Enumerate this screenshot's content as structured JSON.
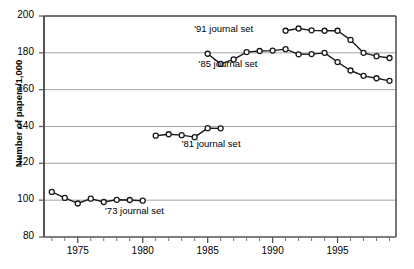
{
  "chart_data": {
    "type": "line",
    "title": "",
    "xlabel": "",
    "ylabel": "Number of papers/1,000",
    "xlim": [
      1972.4,
      1999.5
    ],
    "ylim": [
      80,
      200
    ],
    "ytick_values": [
      80,
      100,
      120,
      140,
      160,
      180,
      200
    ],
    "ytick_labels": [
      "80",
      "100",
      "120",
      "140",
      "160",
      "180",
      "200"
    ],
    "xtick_values": [
      1975,
      1980,
      1985,
      1990,
      1995
    ],
    "xtick_labels": [
      "1975",
      "1980",
      "1985",
      "1990",
      "1995"
    ],
    "xtick_minor_values": [
      1973,
      1974,
      1976,
      1977,
      1978,
      1979,
      1981,
      1982,
      1983,
      1984,
      1986,
      1987,
      1988,
      1989,
      1991,
      1992,
      1993,
      1994,
      1996,
      1997,
      1998,
      1999
    ],
    "grid": "horizontal",
    "legend_position": "inline-annotations",
    "marker": "open-circle",
    "series": [
      {
        "name": "'73 journal set",
        "label": "'73 journal set",
        "label_x": 1977.1,
        "label_y": 93.5,
        "x": [
          1973,
          1974,
          1975,
          1976,
          1977,
          1978,
          1979,
          1980
        ],
        "y": [
          104.5,
          101.2,
          98.2,
          100.8,
          99.0,
          100.2,
          100.1,
          99.7
        ]
      },
      {
        "name": "'81 journal set",
        "label": "'81 journal set",
        "label_x": 1983.0,
        "label_y": 130.0,
        "x": [
          1981,
          1982,
          1983,
          1984,
          1985,
          1986
        ],
        "y": [
          135.0,
          135.8,
          135.3,
          134.2,
          139.1,
          139.0
        ]
      },
      {
        "name": "'85 journal set",
        "label": "'85 journal set",
        "label_x": 1984.3,
        "label_y": 173.5,
        "x": [
          1985,
          1986,
          1987,
          1988,
          1989,
          1990,
          1991,
          1992,
          1993,
          1994,
          1995,
          1996,
          1997,
          1998,
          1999
        ],
        "y": [
          179.5,
          174.0,
          176.4,
          180.4,
          181.0,
          181.2,
          182.0,
          179.2,
          179.3,
          180.0,
          175.0,
          170.4,
          167.5,
          166.2,
          164.8
        ]
      },
      {
        "name": "'91 journal set",
        "label": "'91 journal set",
        "label_x": 1988.5,
        "label_y": 192.5,
        "x": [
          1991,
          1992,
          1993,
          1994,
          1995,
          1996,
          1997,
          1998,
          1999
        ],
        "y": [
          192.0,
          193.2,
          192.2,
          192.0,
          192.0,
          187.0,
          180.0,
          178.2,
          177.2
        ]
      }
    ]
  }
}
